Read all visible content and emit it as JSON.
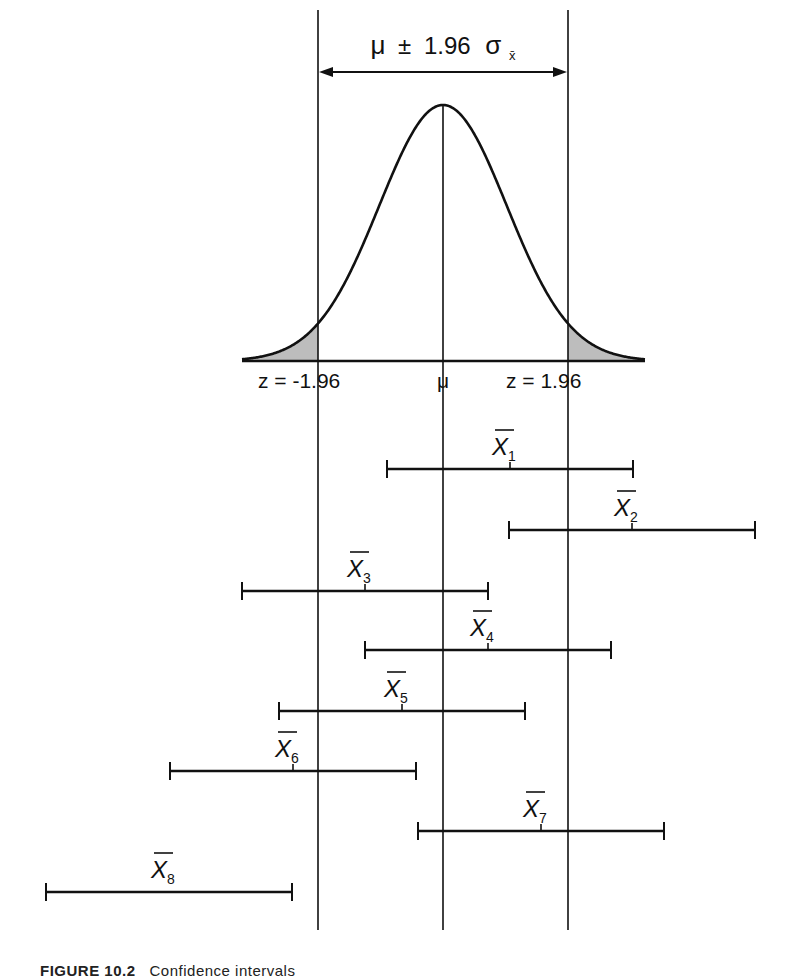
{
  "header": {
    "range_label_mu": "μ",
    "range_label_pm": "±",
    "range_label_value": "1.96",
    "range_label_sigma": "σ",
    "range_label_sub": "x̄"
  },
  "axis": {
    "left_label": "z = -1.96",
    "center_label": "μ",
    "right_label": "z = 1.96"
  },
  "colors": {
    "line": "#111111",
    "tail_fill": "#bdbdbd",
    "background": "#ffffff"
  },
  "geometry": {
    "mu_x": 443,
    "left_crit_x": 318,
    "right_crit_x": 568,
    "half_width_px": 123
  },
  "intervals": [
    {
      "label": "X",
      "sub": "1",
      "center": 510,
      "y": 469
    },
    {
      "label": "X",
      "sub": "2",
      "center": 632,
      "y": 530
    },
    {
      "label": "X",
      "sub": "3",
      "center": 365,
      "y": 591
    },
    {
      "label": "X",
      "sub": "4",
      "center": 488,
      "y": 650
    },
    {
      "label": "X",
      "sub": "5",
      "center": 402,
      "y": 711
    },
    {
      "label": "X",
      "sub": "6",
      "center": 293,
      "y": 771
    },
    {
      "label": "X",
      "sub": "7",
      "center": 541,
      "y": 831
    },
    {
      "label": "X",
      "sub": "8",
      "center": 169,
      "y": 892
    }
  ],
  "caption": {
    "figure_number": "FIGURE 10.2",
    "text": "Confidence intervals"
  }
}
